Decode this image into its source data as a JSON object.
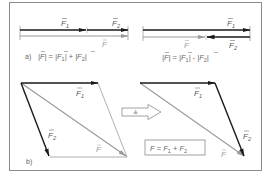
{
  "colors": {
    "frame": "#8a8a8a",
    "force_vector": "#1a1a1a",
    "resultant_vector": "#9a9a9a",
    "construction_line": "#9a9a9a",
    "text": "#555555"
  },
  "part_a": {
    "tag": "a)",
    "left": {
      "vectors": [
        {
          "name": "F1",
          "label": "F",
          "sub": "1",
          "from": [
            20,
            30
          ],
          "to": [
            86,
            30
          ],
          "style": "force"
        },
        {
          "name": "F2",
          "label": "F",
          "sub": "2",
          "from": [
            87,
            30
          ],
          "to": [
            128,
            30
          ],
          "style": "force"
        },
        {
          "name": "F",
          "label": "F",
          "sub": "",
          "from": [
            20,
            36
          ],
          "to": [
            128,
            36
          ],
          "style": "resultant"
        }
      ],
      "equation": {
        "lhs": "|F|",
        "op1": "=",
        "t1": "|F₁|",
        "op2": "+",
        "t2": "|F₂|"
      }
    },
    "right": {
      "vectors": [
        {
          "name": "F1",
          "label": "F",
          "sub": "1",
          "from": [
            143,
            30
          ],
          "to": [
            250,
            30
          ],
          "style": "force"
        },
        {
          "name": "F2",
          "label": "F",
          "sub": "2",
          "from": [
            250,
            37
          ],
          "to": [
            206,
            37
          ],
          "style": "force"
        },
        {
          "name": "F",
          "label": "F",
          "sub": "",
          "from": [
            143,
            37
          ],
          "to": [
            205,
            37
          ],
          "style": "resultant"
        }
      ],
      "equation": {
        "lhs": "|F|",
        "op1": "=",
        "t1": "|F₁|",
        "op2": "-",
        "t2": "|F₂|"
      }
    }
  },
  "part_b": {
    "tag": "b)",
    "parallelogram": {
      "origin": [
        21,
        83
      ],
      "F1_end": [
        98,
        83
      ],
      "F2_end": [
        50,
        157
      ],
      "F_end": [
        127,
        157
      ]
    },
    "equivalence_arrow_symbol": "≙",
    "triangle": {
      "origin": [
        140,
        83
      ],
      "F1_end": [
        215,
        83
      ],
      "F_end": [
        245,
        157
      ]
    },
    "formula": {
      "lhs": "F",
      "op1": "=",
      "t1": "F",
      "t1_sub": "1",
      "op2": "+",
      "t2": "F",
      "t2_sub": "2"
    }
  }
}
